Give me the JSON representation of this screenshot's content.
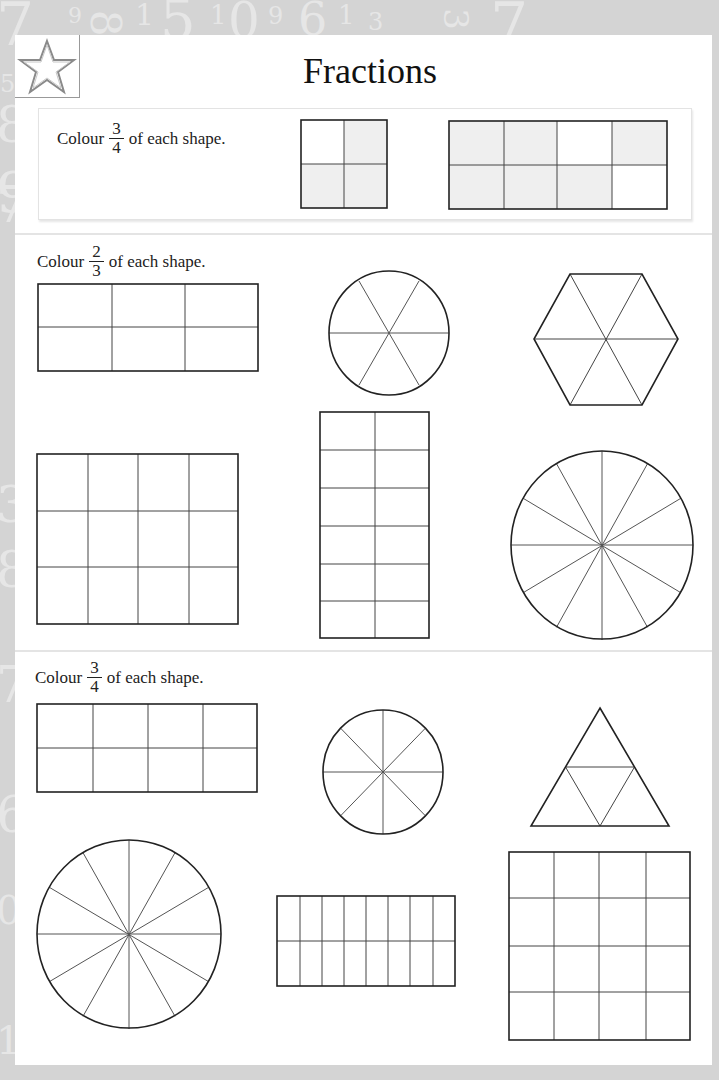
{
  "page": {
    "title": "Fractions",
    "icon": "star-icon",
    "background_numbers": [
      "7",
      "9",
      "8",
      "1",
      "5",
      "1",
      "0",
      "9",
      "6",
      "1",
      "3",
      "7",
      "3",
      "7",
      "5",
      "8",
      "9",
      "3",
      "8",
      "7",
      "6",
      "0",
      "1",
      "9"
    ]
  },
  "example": {
    "instruction_prefix": "Colour",
    "fraction": {
      "numerator": "3",
      "denominator": "4"
    },
    "instruction_suffix": "of each shape.",
    "shapes": [
      {
        "type": "grid",
        "rows": 2,
        "cols": 2,
        "shaded_cells": [
          1,
          2,
          3
        ]
      },
      {
        "type": "grid",
        "rows": 2,
        "cols": 4,
        "shaded_cells": [
          0,
          1,
          3,
          4,
          5,
          6
        ]
      }
    ],
    "shade_color": "#efefef"
  },
  "sections": [
    {
      "instruction_prefix": "Colour",
      "fraction": {
        "numerator": "2",
        "denominator": "3"
      },
      "instruction_suffix": "of each shape.",
      "shapes": [
        {
          "type": "grid",
          "rows": 2,
          "cols": 3
        },
        {
          "type": "circle",
          "segments": 6
        },
        {
          "type": "hexagon",
          "segments": 6
        },
        {
          "type": "grid",
          "rows": 3,
          "cols": 4
        },
        {
          "type": "grid",
          "rows": 6,
          "cols": 2
        },
        {
          "type": "circle",
          "segments": 12
        }
      ]
    },
    {
      "instruction_prefix": "Colour",
      "fraction": {
        "numerator": "3",
        "denominator": "4"
      },
      "instruction_suffix": "of each shape.",
      "shapes": [
        {
          "type": "grid",
          "rows": 2,
          "cols": 4
        },
        {
          "type": "circle",
          "segments": 8
        },
        {
          "type": "triangle",
          "segments": 4
        },
        {
          "type": "circle",
          "segments": 12
        },
        {
          "type": "grid",
          "rows": 2,
          "cols": 8
        },
        {
          "type": "grid",
          "rows": 4,
          "cols": 4
        }
      ]
    }
  ],
  "colors": {
    "background": "#d4d4d4",
    "paper": "#ffffff",
    "line": "#222222",
    "shade": "#efefef"
  }
}
